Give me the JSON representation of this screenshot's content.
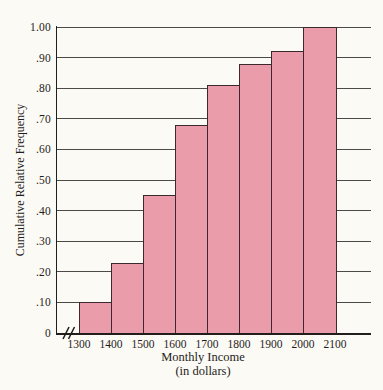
{
  "chart_data": {
    "type": "bar",
    "subtype": "cumulative-relative-frequency-histogram",
    "title": "",
    "xlabel": "Monthly Income",
    "xlabel_sub": "(in dollars)",
    "ylabel": "Cumulative Relative Frequency",
    "categories": [
      "1300-1400",
      "1400-1500",
      "1500-1600",
      "1600-1700",
      "1700-1800",
      "1800-1900",
      "1900-2000",
      "2000-2100"
    ],
    "values": [
      0.1,
      0.23,
      0.45,
      0.68,
      0.81,
      0.88,
      0.92,
      1.0
    ],
    "x_tick_labels": [
      "1300",
      "1400",
      "1500",
      "1600",
      "1700",
      "1800",
      "1900",
      "2000",
      "2100"
    ],
    "y_tick_labels": [
      "1.00",
      ".90",
      ".80",
      ".70",
      ".60",
      ".50",
      ".40",
      ".30",
      ".20",
      ".10",
      "0"
    ],
    "y_tick_values": [
      1.0,
      0.9,
      0.8,
      0.7,
      0.6,
      0.5,
      0.4,
      0.3,
      0.2,
      0.1,
      0
    ],
    "ylim": [
      0,
      1.0
    ],
    "grid": true,
    "axis_break": true,
    "legend": "none",
    "colors": {
      "bar_fill": "#ea9cab",
      "bar_border": "#3c2930",
      "gridline": "#4c4a46",
      "axis": "#211e1c",
      "text": "#1f1d1b",
      "background": "#fbfaf5"
    }
  }
}
